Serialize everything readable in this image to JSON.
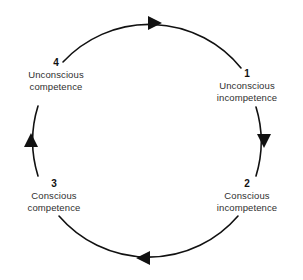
{
  "diagram": {
    "type": "cycle",
    "direction": "clockwise",
    "colors": {
      "arc": "#111111",
      "arrow": "#111111",
      "number_text": "#111111",
      "label_text": "#2f2f2f",
      "background": "#ffffff"
    },
    "circle": {
      "center_x": 147,
      "center_y": 140,
      "radius": 118
    },
    "stages": [
      {
        "number": "1",
        "line1": "Unconscious",
        "line2": "incompetence",
        "position": "right"
      },
      {
        "number": "2",
        "line1": "Conscious",
        "line2": "incompetence",
        "position": "bottom-right"
      },
      {
        "number": "3",
        "line1": "Conscious",
        "line2": "competence",
        "position": "bottom-left"
      },
      {
        "number": "4",
        "line1": "Unconscious",
        "line2": "competence",
        "position": "top-left"
      }
    ],
    "arrows": [
      {
        "name": "arrow-top",
        "points": "right"
      },
      {
        "name": "arrow-right",
        "points": "down"
      },
      {
        "name": "arrow-bottom",
        "points": "left"
      },
      {
        "name": "arrow-left",
        "points": "up"
      }
    ]
  }
}
